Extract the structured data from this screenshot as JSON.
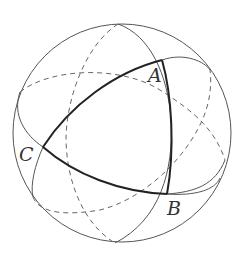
{
  "figure": {
    "sphere": {
      "cx": 122,
      "cy": 133,
      "r": 109
    },
    "vertices": [
      {
        "id": "A",
        "label": "A",
        "x": 162,
        "y": 60,
        "label_x": 148,
        "label_y": 82
      },
      {
        "id": "B",
        "label": "B",
        "x": 167,
        "y": 194,
        "label_x": 167,
        "label_y": 215
      },
      {
        "id": "C",
        "label": "C",
        "x": 43,
        "y": 147,
        "label_x": 19,
        "label_y": 161
      }
    ],
    "colors": {
      "stroke": "#555555",
      "triangle": "#222222",
      "background": "#ffffff"
    }
  }
}
